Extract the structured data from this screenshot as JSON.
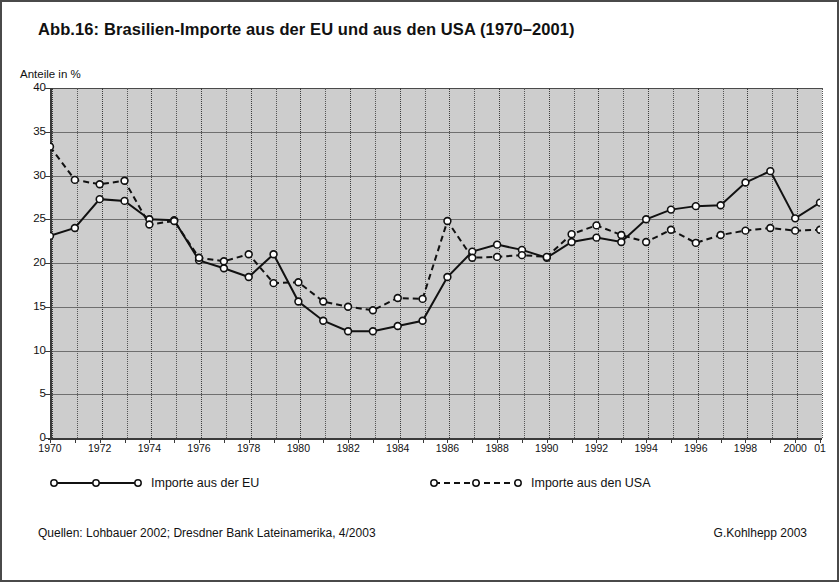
{
  "figure": {
    "title": "Abb.16: Brasilien-Importe aus der EU und aus den USA (1970–2001)",
    "ylabel": "Anteile in %",
    "source": "Quellen: Lohbauer 2002; Dresdner Bank Lateinamerika, 4/2003",
    "credit": "G.Kohlhepp 2003",
    "border_color": "#4a4a4a",
    "plot_bg": "#cdcdcd",
    "line_color": "#111111"
  },
  "legend": {
    "position": "below-axis",
    "entries": [
      {
        "label": "Importe aus der EU",
        "style": "solid",
        "marker": "open-circle",
        "icon": "solid-line-marker-icon"
      },
      {
        "label": "Importe aus den USA",
        "style": "dashed",
        "marker": "open-circle",
        "icon": "dashed-line-marker-icon"
      }
    ]
  },
  "chart_data": {
    "type": "line",
    "title": "Abb.16: Brasilien-Importe aus der EU und aus den USA (1970–2001)",
    "xlabel": "",
    "ylabel": "Anteile in %",
    "ylim": [
      0,
      40
    ],
    "yticks": [
      0,
      5,
      10,
      15,
      20,
      25,
      30,
      35,
      40
    ],
    "xlim": [
      1970,
      2001
    ],
    "x": [
      1970,
      1971,
      1972,
      1973,
      1974,
      1975,
      1976,
      1977,
      1978,
      1979,
      1980,
      1981,
      1982,
      1983,
      1984,
      1985,
      1986,
      1987,
      1988,
      1989,
      1990,
      1991,
      1992,
      1993,
      1994,
      1995,
      1996,
      1997,
      1998,
      1999,
      2000,
      2001
    ],
    "xtick_labels": [
      "1970",
      "",
      "1972",
      "",
      "1974",
      "",
      "1976",
      "",
      "1978",
      "",
      "1980",
      "",
      "1982",
      "",
      "1984",
      "",
      "1986",
      "",
      "1988",
      "",
      "1990",
      "",
      "1992",
      "",
      "1994",
      "",
      "1996",
      "",
      "1998",
      "",
      "2000",
      "01"
    ],
    "grid": {
      "horizontal": "solid",
      "vertical": "dotted"
    },
    "legend_position": "below",
    "series": [
      {
        "name": "Importe aus der EU",
        "style": "solid",
        "marker": "open-circle",
        "values": [
          23.1,
          24.0,
          27.3,
          27.1,
          25.0,
          24.9,
          20.3,
          19.4,
          18.4,
          21.0,
          15.6,
          13.4,
          12.2,
          12.2,
          12.8,
          13.4,
          18.4,
          21.3,
          22.1,
          21.5,
          20.6,
          22.4,
          22.9,
          22.4,
          25.0,
          26.1,
          26.5,
          26.6,
          29.2,
          30.5,
          25.1,
          26.9
        ]
      },
      {
        "name": "Importe aus den USA",
        "style": "dashed",
        "marker": "open-circle",
        "values": [
          33.3,
          29.5,
          29.0,
          29.4,
          24.4,
          24.8,
          20.6,
          20.2,
          21.0,
          17.7,
          17.8,
          15.6,
          15.0,
          14.6,
          16.0,
          15.9,
          24.8,
          20.6,
          20.7,
          20.9,
          20.7,
          23.3,
          24.3,
          23.2,
          22.4,
          23.8,
          22.3,
          23.2,
          23.7,
          24.0,
          23.7,
          23.8
        ]
      }
    ]
  }
}
